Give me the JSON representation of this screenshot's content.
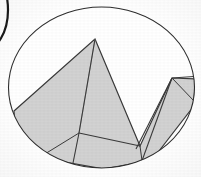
{
  "figure": {
    "canvas": {
      "width": 201,
      "height": 177,
      "background": "#ffffff"
    },
    "colors": {
      "paper": "#ffffff",
      "polygon_fill": "#d2d2d2",
      "polygon_stroke": "#3a3a3a",
      "ellipse_stroke": "#2e2e2e",
      "inner_line": "#8e8e8e",
      "partial_arc_stroke": "#1a1a1a"
    },
    "shapes": {
      "main_ellipse": {
        "name": "main-ellipse",
        "cx": 101.5,
        "cy": 87.5,
        "rx": 93,
        "ry": 80.5,
        "fill": "none",
        "stroke": "#2e2e2e",
        "stroke_width": 1.1
      },
      "partial_arc": {
        "name": "left-partial-ellipse-arc",
        "cx": -16,
        "cy": 10,
        "rx": 24,
        "ry": 40,
        "fill": "none",
        "stroke": "#1a1a1a",
        "stroke_width": 2.2
      },
      "polygon": {
        "name": "zigzag-polygon",
        "fill": "#d2d2d2",
        "stroke": "#3a3a3a",
        "stroke_width": 1.2,
        "points": [
          {
            "label": "left-base",
            "x": 14,
            "y": 111
          },
          {
            "label": "central-peak",
            "x": 95,
            "y": 39
          },
          {
            "label": "central-right-base",
            "x": 140,
            "y": 146
          },
          {
            "label": "right-peak",
            "x": 172,
            "y": 78
          },
          {
            "label": "right-lower",
            "x": 196,
            "y": 79
          },
          {
            "label": "right-ellipse-edge",
            "x": 193,
            "y": 107
          },
          {
            "label": "bottom-right-edge",
            "x": 152,
            "y": 160
          },
          {
            "label": "bottom-mid",
            "x": 104,
            "y": 169
          },
          {
            "label": "bottom-left-edge",
            "x": 48,
            "y": 159
          },
          {
            "label": "left-ellipse-edge",
            "x": 15,
            "y": 130
          }
        ]
      },
      "inner_lines": [
        {
          "name": "inner-diagonal-peak-to-node",
          "x1": 95,
          "y1": 39,
          "x2": 79,
          "y2": 133,
          "stroke": "#9a9a9a",
          "stroke_width": 1.0
        },
        {
          "name": "node-to-central-peak-edge",
          "x1": 79,
          "y1": 133,
          "x2": 95,
          "y2": 39,
          "stroke": "#3a3a3a",
          "stroke_width": 1.1
        },
        {
          "name": "node-to-right-base",
          "x1": 79,
          "y1": 133,
          "x2": 140,
          "y2": 146,
          "stroke": "#3a3a3a",
          "stroke_width": 1.2
        },
        {
          "name": "node-to-bottom-edge",
          "x1": 79,
          "y1": 133,
          "x2": 72,
          "y2": 168,
          "stroke": "#3a3a3a",
          "stroke_width": 1.1
        },
        {
          "name": "node-to-lower-left-edge",
          "x1": 79,
          "y1": 133,
          "x2": 40,
          "y2": 157,
          "stroke": "#3a3a3a",
          "stroke_width": 1.0
        },
        {
          "name": "right-peak-to-sliver-base",
          "x1": 172,
          "y1": 78,
          "x2": 136,
          "y2": 149,
          "stroke": "#3a3a3a",
          "stroke_width": 1.1
        },
        {
          "name": "right-peak-to-bottom-edge",
          "x1": 172,
          "y1": 78,
          "x2": 139,
          "y2": 169,
          "stroke": "#3a3a3a",
          "stroke_width": 1.1
        },
        {
          "name": "right-peak-to-right-edge",
          "x1": 172,
          "y1": 78,
          "x2": 194,
          "y2": 101,
          "stroke": "#3a3a3a",
          "stroke_width": 1.0
        },
        {
          "name": "right-peak-horizontal-to-edge",
          "x1": 172,
          "y1": 78,
          "x2": 201,
          "y2": 76,
          "stroke": "#3a3a3a",
          "stroke_width": 1.0
        },
        {
          "name": "central-base-to-bottom-edge",
          "x1": 140,
          "y1": 146,
          "x2": 143,
          "y2": 168,
          "stroke": "#3a3a3a",
          "stroke_width": 1.0
        }
      ]
    }
  }
}
